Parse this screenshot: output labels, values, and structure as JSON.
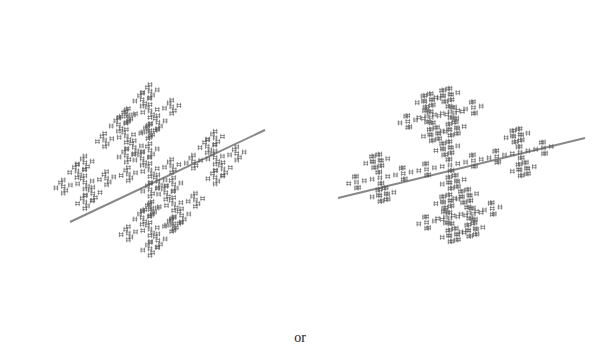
{
  "figure": {
    "separator_text": "or",
    "ink_color": "#555555",
    "background": "#ffffff",
    "panels": [
      {
        "name": "fractal-left",
        "description": "3D cross fractal cluster, view A",
        "center": [
          150,
          170
        ],
        "size": 105,
        "depth": 3,
        "rotation": -20,
        "tilt": 0.55,
        "spine": [
          [
            70,
            222
          ],
          [
            265,
            130
          ]
        ]
      },
      {
        "name": "fractal-right",
        "description": "3D cross fractal cluster, view B",
        "center": [
          150,
          165
        ],
        "size": 110,
        "depth": 3,
        "rotation": -15,
        "tilt": 0.75,
        "spine": [
          [
            38,
            198
          ],
          [
            285,
            138
          ]
        ]
      }
    ]
  }
}
